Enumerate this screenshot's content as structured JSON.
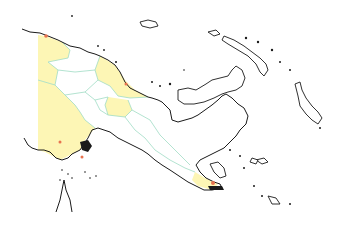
{
  "map": {
    "subject": "Papua New Guinea provinces",
    "colors": {
      "background": "#ffffff",
      "highlight_fill": "#fdf6b5",
      "default_fill": "#ffffff",
      "coastline": "#1a1a1a",
      "province_border": "#9fdcc4",
      "marker": "#e8734f",
      "marker_dark": "#c0392b"
    },
    "provinces_highlighted": [
      "Western (Fly)",
      "West Sepik (Sandaun)",
      "East Sepik coast strip",
      "Madang",
      "Eastern Highlands",
      "Milne Bay (eastern tip)"
    ],
    "provinces_unshaded": [
      "Enga",
      "Southern Highlands",
      "Western Highlands",
      "Simbu",
      "Morobe",
      "Gulf",
      "Central",
      "Oro",
      "Manus",
      "New Ireland",
      "New Britain",
      "Bougainville"
    ],
    "markers": [
      {
        "label": "north-coast-west",
        "x": 46,
        "y": 36
      },
      {
        "label": "madang-coast",
        "x": 126,
        "y": 84
      },
      {
        "label": "fly-delta",
        "x": 60,
        "y": 142
      },
      {
        "label": "daru-area",
        "x": 82,
        "y": 157
      },
      {
        "label": "milne-bay",
        "x": 213,
        "y": 183
      }
    ]
  }
}
